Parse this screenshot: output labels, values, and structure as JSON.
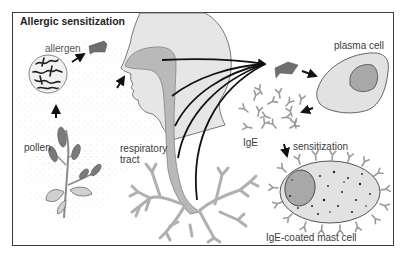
{
  "diagram": {
    "title": "Allergic sensitization",
    "labels": {
      "allergen": "allergen",
      "pollen": "pollen",
      "respiratory_tract": "respiratory",
      "respiratory_tract_2": "tract",
      "plasma_cell": "plasma cell",
      "ige": "IgE",
      "sensitization": "sensitization",
      "mast_cell": "IgE-coated mast cell"
    },
    "colors": {
      "frame": "#3c3c3c",
      "head_fill": "#e6e6e6",
      "airway_fill": "#b9b9b9",
      "allergen_fill": "#6e6e6e",
      "cell_fill": "#e2e2e2",
      "nucleus_fill": "#a8a8a8",
      "arrow": "#111111",
      "antibody": "#9a9a9a"
    },
    "flow": [
      "pollen -> allergen",
      "allergen -> nose (inhalation)",
      "respiratory tract -> allergen presentation",
      "allergen -> plasma cell",
      "plasma cell -> IgE",
      "IgE -> sensitization -> IgE-coated mast cell"
    ]
  }
}
